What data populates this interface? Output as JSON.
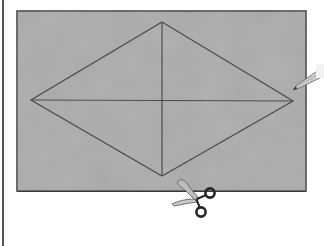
{
  "figure": {
    "colors": {
      "paper": "#a9a9a9",
      "paper_border": "#4a4a4a",
      "lines": "#4d4d4d",
      "page_rule": "#555555",
      "pencil_body": "#c8c8c8",
      "scissors_handle": "#2a2a2a",
      "scissors_blade": "#bdbdbd"
    },
    "rectangle": {
      "x": 17,
      "y": 11,
      "width": 289,
      "height": 180
    },
    "rhombus": {
      "top": [
        162,
        22
      ],
      "right": [
        293,
        101
      ],
      "bottom": [
        162,
        176
      ],
      "left": [
        31,
        100
      ]
    },
    "diagonals": [
      {
        "from": [
          31,
          100
        ],
        "to": [
          293,
          101
        ]
      },
      {
        "from": [
          162,
          22
        ],
        "to": [
          162,
          176
        ]
      }
    ],
    "icons": [
      "pencil-icon",
      "scissors-icon"
    ]
  }
}
